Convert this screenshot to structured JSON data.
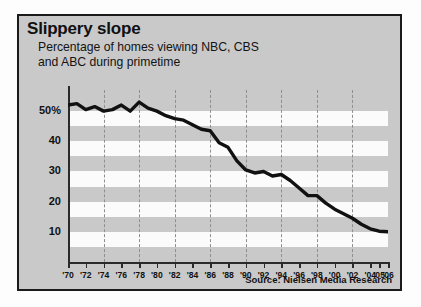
{
  "panel": {
    "title": "Slippery slope",
    "subtitle_line1": "Percentage of homes viewing NBC, CBS",
    "subtitle_line2": "and ABC during primetime",
    "source": "Source: Nielsen Media Research",
    "background_color": "#c9c9c9",
    "border_color": "#1a1a1a",
    "line_color": "#111111"
  },
  "chart_data": {
    "type": "line",
    "title": "Slippery slope",
    "subtitle": "Percentage of homes viewing NBC, CBS and ABC during primetime",
    "xlabel": "",
    "ylabel": "",
    "ylim": [
      0,
      57
    ],
    "xlim": [
      1970,
      2006
    ],
    "grid": "horizontal bands (alternating white/gray) and dashed vertical gridlines every 4 years",
    "legend": "none",
    "source": "Source: Nielsen Media Research",
    "ytick_labels": [
      "50%",
      "40",
      "30",
      "20",
      "10"
    ],
    "ytick_values": [
      50,
      40,
      30,
      20,
      10
    ],
    "xtick_labels": [
      "'70",
      "'72",
      "'74",
      "'76",
      "'78",
      "'80",
      "'82",
      "'84",
      "'86",
      "'88",
      "'90",
      "'92",
      "'94",
      "'96",
      "'98",
      "'00",
      "'02",
      "'04",
      "'05",
      "'06"
    ],
    "xtick_values": [
      1970,
      1972,
      1974,
      1976,
      1978,
      1980,
      1982,
      1984,
      1986,
      1988,
      1990,
      1992,
      1994,
      1996,
      1998,
      2000,
      2002,
      2004,
      2005,
      2006
    ],
    "vertical_gridline_years": [
      1974,
      1978,
      1982,
      1986,
      1990,
      1994,
      1998,
      2002
    ],
    "x": [
      1970,
      1971,
      1972,
      1973,
      1974,
      1975,
      1976,
      1977,
      1978,
      1979,
      1980,
      1981,
      1982,
      1983,
      1984,
      1985,
      1986,
      1987,
      1988,
      1989,
      1990,
      1991,
      1992,
      1993,
      1994,
      1995,
      1996,
      1997,
      1998,
      1999,
      2000,
      2001,
      2002,
      2003,
      2004,
      2005,
      2006
    ],
    "values": [
      52,
      52.5,
      50.5,
      51.5,
      50,
      50.5,
      52,
      50,
      53,
      51,
      50,
      48.5,
      47.5,
      47,
      45.5,
      44,
      43.5,
      39.5,
      38,
      33.5,
      30.5,
      29.5,
      30,
      28.5,
      29,
      27,
      24.5,
      22,
      22,
      19.5,
      17.5,
      16,
      14.5,
      12.5,
      11,
      10.2,
      10
    ],
    "series": [
      {
        "name": "Percentage of homes viewing NBC, CBS and ABC during primetime",
        "values": [
          52,
          52.5,
          50.5,
          51.5,
          50,
          50.5,
          52,
          50,
          53,
          51,
          50,
          48.5,
          47.5,
          47,
          45.5,
          44,
          43.5,
          39.5,
          38,
          33.5,
          30.5,
          29.5,
          30,
          28.5,
          29,
          27,
          24.5,
          22,
          22,
          19.5,
          17.5,
          16,
          14.5,
          12.5,
          11,
          10.2,
          10
        ]
      }
    ]
  }
}
